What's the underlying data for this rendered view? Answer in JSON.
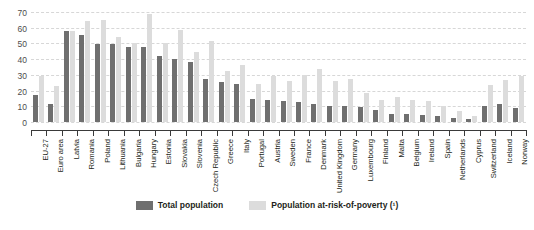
{
  "chart_data": {
    "type": "bar",
    "title": "",
    "subtitle": "",
    "xlabel": "",
    "ylabel": "",
    "ylim": [
      0,
      70
    ],
    "yticks": [
      0,
      10,
      20,
      30,
      40,
      50,
      60,
      70
    ],
    "grid": true,
    "legend_position": "bottom",
    "colors": {
      "total_population": "#6f6f6f",
      "population_at_risk_of_poverty": "#dcdcdc",
      "gridline": "#d7d7d7",
      "axis": "#3a3a3a",
      "background": "#ffffff"
    },
    "categories": [
      "EU-27",
      "Euro area",
      "Latvia",
      "Romania",
      "Poland",
      "Lithuania",
      "Bulgaria",
      "Hungary",
      "Estonia",
      "Slovakia",
      "Slovenia",
      "Czech Republic",
      "Greece",
      "Italy",
      "Portugal",
      "Austria",
      "Sweden",
      "France",
      "Denmark",
      "United Kingdom",
      "Germany",
      "Luxembourg",
      "Finland",
      "Malta",
      "Belgium",
      "Ireland",
      "Spain",
      "Netherlands",
      "Cyprus",
      "Switzerland",
      "Iceland",
      "Norway"
    ],
    "series": [
      {
        "name": "Total population",
        "color": "#6f6f6f",
        "values": [
          17.5,
          11.2,
          58.0,
          55.5,
          49.5,
          49.5,
          47.5,
          47.5,
          41.8,
          40.2,
          38.5,
          27.2,
          25.7,
          24.1,
          14.7,
          13.7,
          13.3,
          12.5,
          11.2,
          10.5,
          10.1,
          9.3,
          7.7,
          5.4,
          5.0,
          4.6,
          4.1,
          2.4,
          1.7,
          10.4,
          11.3,
          8.8
        ]
      },
      {
        "name": "Population at-risk-of-poverty (¹)",
        "color": "#dcdcdc",
        "values": [
          29.5,
          22.9,
          58.0,
          64.5,
          64.7,
          53.8,
          50.2,
          68.8,
          50.5,
          58.5,
          44.5,
          51.3,
          32.3,
          36.1,
          23.9,
          29.5,
          26.4,
          30.2,
          33.9,
          26.1,
          27.6,
          18.3,
          14.1,
          16.2,
          13.9,
          13.6,
          9.9,
          6.9,
          3.9,
          23.7,
          26.5,
          29.1
        ]
      }
    ]
  },
  "legend": {
    "items": [
      {
        "label": "Total population",
        "color": "#6f6f6f"
      },
      {
        "label": "Population at-risk-of-poverty (¹)",
        "color": "#dcdcdc"
      }
    ]
  }
}
